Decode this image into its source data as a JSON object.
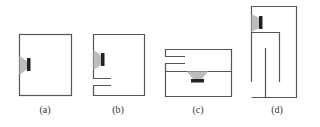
{
  "figure": {
    "panels": [
      {
        "id": "a",
        "label": "(a)",
        "description": "Sealed enclosure with speaker on left wall"
      },
      {
        "id": "b",
        "label": "(b)",
        "description": "Bass-reflex enclosure with port below speaker"
      },
      {
        "id": "c",
        "label": "(c)",
        "description": "Enclosure with speaker facing down into internal chamber and port at top"
      },
      {
        "id": "d",
        "label": "(d)",
        "description": "Transmission-line / folded enclosure with speaker at top"
      }
    ],
    "colors": {
      "line": "#555555",
      "cone": "#bdbdbd",
      "magnet": "#222222"
    }
  }
}
